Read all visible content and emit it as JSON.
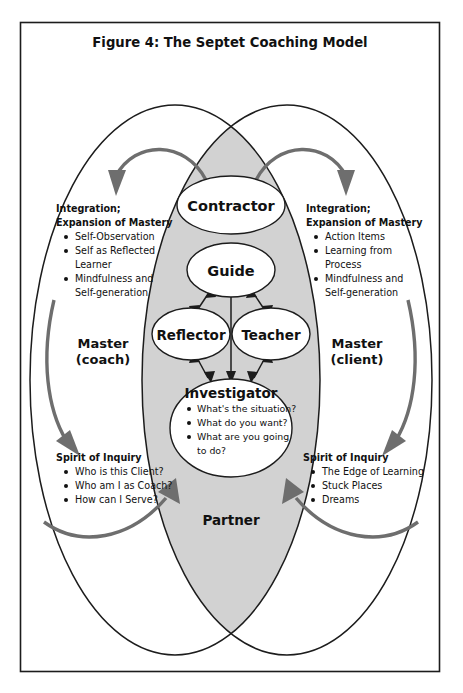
{
  "figure": {
    "title": "Figure 4: The Septet Coaching Model"
  },
  "nodes": [
    {
      "id": "contractor",
      "label": "Contractor"
    },
    {
      "id": "guide",
      "label": "Guide"
    },
    {
      "id": "reflector",
      "label": "Reflector"
    },
    {
      "id": "teacher",
      "label": "Teacher"
    },
    {
      "id": "investigator",
      "label": "Investigator"
    },
    {
      "id": "partner",
      "label": "Partner"
    }
  ],
  "investigator": {
    "label": "Investigator",
    "items": [
      "What's the situation?",
      "What do you want?",
      "What are you going",
      "to do?"
    ]
  },
  "left": {
    "master_line1": "Master",
    "master_line2": "(coach)",
    "integration": {
      "head_line1": "Integration;",
      "head_line2": "Expansion of Mastery",
      "items": [
        "Self-Observation",
        "Self as Reflected",
        "Learner",
        "Mindfulness and",
        "Self-generation"
      ]
    },
    "inquiry": {
      "head": "Spirit of Inquiry",
      "items": [
        "Who is this Client?",
        "Who am I as Coach?",
        "How can I Serve?"
      ]
    }
  },
  "right": {
    "master_line1": "Master",
    "master_line2": "(client)",
    "integration": {
      "head_line1": "Integration;",
      "head_line2": "Expansion of Mastery",
      "items": [
        "Action Items",
        "Learning from",
        "Process",
        "Mindfulness and",
        "Self-generation"
      ]
    },
    "inquiry": {
      "head": "Spirit of Inquiry",
      "items": [
        "The Edge of Learning",
        "Stuck Places",
        "Dreams"
      ]
    }
  },
  "colors": {
    "line": "#1c1c1c",
    "shade": "#d2d2d2",
    "arrow_gray": "#6e6e6e",
    "background": "#ffffff"
  }
}
